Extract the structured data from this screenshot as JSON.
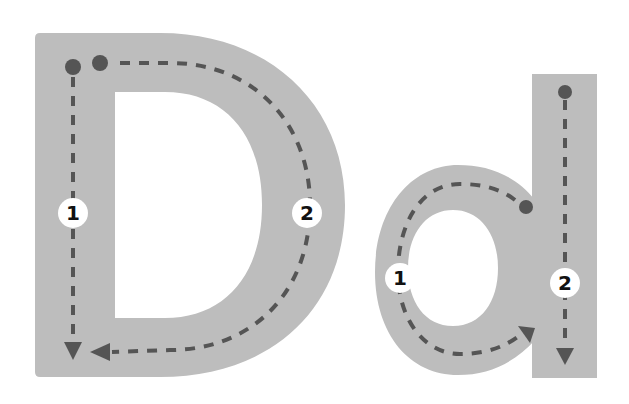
{
  "worksheet": {
    "subject": "Letter tracing",
    "letters": [
      {
        "id": "uppercase-D",
        "glyph": "D",
        "case": "uppercase",
        "strokes": [
          {
            "number": "1",
            "direction": "straight down"
          },
          {
            "number": "2",
            "direction": "across, curve around, back to bottom of line"
          }
        ]
      },
      {
        "id": "lowercase-d",
        "glyph": "d",
        "case": "lowercase",
        "strokes": [
          {
            "number": "1",
            "direction": "counter-clockwise circle"
          },
          {
            "number": "2",
            "direction": "straight down"
          }
        ]
      }
    ]
  },
  "colors": {
    "background": "#ffffff",
    "letter_fill": "#bdbdbd",
    "guide_dark": "#555555",
    "badge_fill": "#ffffff",
    "badge_text": "#111111"
  }
}
